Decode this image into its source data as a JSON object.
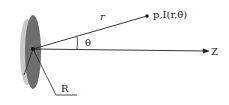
{
  "diagram": {
    "labels": {
      "radius_vector": "r",
      "point": "p,I(r,θ)",
      "angle": "θ",
      "axis": "Z",
      "disc_radius": "R"
    },
    "colors": {
      "disc_front": "#6e6e6e",
      "disc_back": "#c8c8c8",
      "lines": "#222222",
      "background": "#ffffff"
    }
  }
}
